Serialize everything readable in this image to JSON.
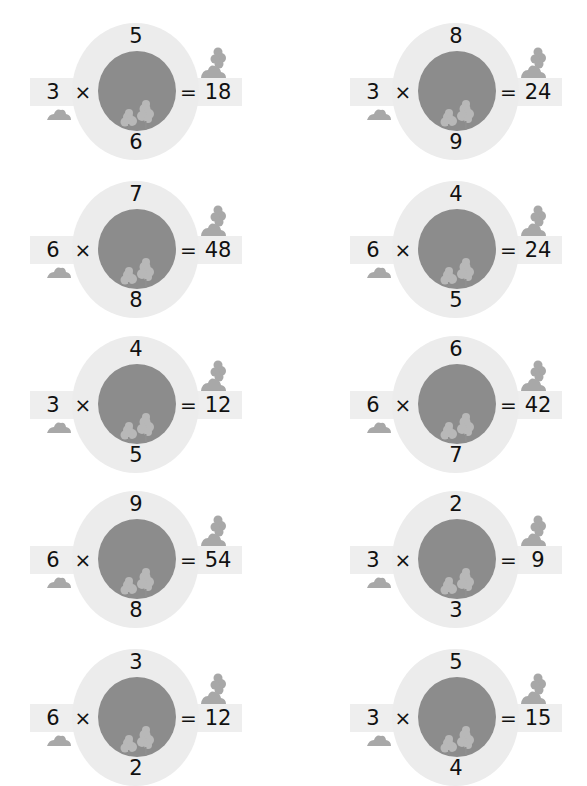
{
  "worksheet": {
    "type": "multiplication-wheel",
    "colors": {
      "outer_ring": "#ececec",
      "inner_circle": "#8c8c8c",
      "band": "#eeeeee",
      "bush": "#a8a8a8",
      "inner_tree": "#b8b8b8",
      "text": "#111111"
    },
    "operator": "×",
    "equals": "=",
    "problems": [
      {
        "top": "5",
        "bottom": "6",
        "multiplier": "3",
        "result": "18"
      },
      {
        "top": "8",
        "bottom": "9",
        "multiplier": "3",
        "result": "24"
      },
      {
        "top": "7",
        "bottom": "8",
        "multiplier": "6",
        "result": "48"
      },
      {
        "top": "4",
        "bottom": "5",
        "multiplier": "6",
        "result": "24"
      },
      {
        "top": "4",
        "bottom": "5",
        "multiplier": "3",
        "result": "12"
      },
      {
        "top": "6",
        "bottom": "7",
        "multiplier": "6",
        "result": "42"
      },
      {
        "top": "9",
        "bottom": "8",
        "multiplier": "6",
        "result": "54"
      },
      {
        "top": "2",
        "bottom": "3",
        "multiplier": "3",
        "result": "9"
      },
      {
        "top": "3",
        "bottom": "2",
        "multiplier": "6",
        "result": "12"
      },
      {
        "top": "5",
        "bottom": "4",
        "multiplier": "3",
        "result": "15"
      }
    ]
  }
}
